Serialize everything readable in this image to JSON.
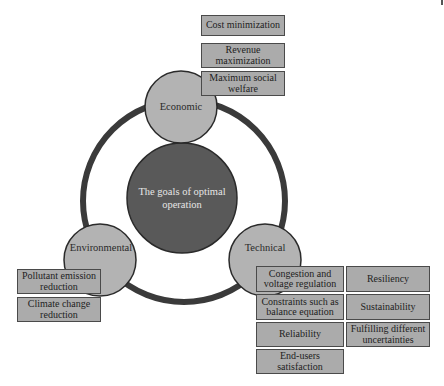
{
  "diagram": {
    "center": {
      "label": "The goals of optimal operation",
      "fill": "#595959"
    },
    "ring_color": "#3a3a3a",
    "node_fill": "#b3b3b3",
    "box_fill": "#ababab",
    "categories": [
      {
        "name": "Economic",
        "items": [
          "Cost minimization",
          "Revenue maximization",
          "Maximum social welfare"
        ]
      },
      {
        "name": "Environmental",
        "items": [
          "Pollutant emission reduction",
          "Climate change reduction"
        ]
      },
      {
        "name": "Technical",
        "items_col1": [
          "Congestion and voltage regulation",
          "Constraints such as balance equation",
          "Reliability",
          "End-users satisfaction"
        ],
        "items_col2": [
          "Resiliency",
          "Sustainability",
          "Fulfilling different uncertainties"
        ]
      }
    ]
  }
}
